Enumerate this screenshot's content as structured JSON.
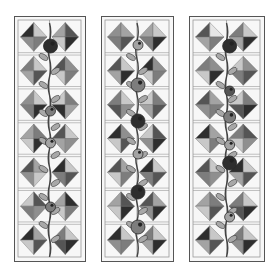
{
  "image": {
    "description": "Three vertical quilt table-runner panels with hourglass diamond blocks and a climbing vine with berries",
    "background": "#ffffff"
  },
  "shades": {
    "black": "#2e2e2e",
    "dark": "#555555",
    "mid": "#7d7d7d",
    "midlight": "#a3a3a3",
    "light": "#c8c8c8",
    "pale": "#e6e6e6",
    "print": "#8f8f8f"
  },
  "panels": [
    {
      "name": "left-panel",
      "x": 14,
      "width": 72,
      "rows": [
        [
          [
            "black",
            "light",
            "print",
            "mid"
          ],
          [
            "midlight",
            "dark",
            "light",
            "black"
          ]
        ],
        [
          [
            "mid",
            "light",
            "midlight",
            "dark"
          ],
          [
            "dark",
            "print",
            "light",
            "mid"
          ]
        ],
        [
          [
            "print",
            "light",
            "mid",
            "black"
          ],
          [
            "light",
            "mid",
            "black",
            "midlight"
          ]
        ],
        [
          [
            "midlight",
            "mid",
            "light",
            "black"
          ],
          [
            "dark",
            "light",
            "midlight",
            "print"
          ]
        ],
        [
          [
            "dark",
            "midlight",
            "print",
            "light"
          ],
          [
            "black",
            "light",
            "mid",
            "dark"
          ]
        ],
        [
          [
            "light",
            "dark",
            "mid",
            "print"
          ],
          [
            "midlight",
            "black",
            "light",
            "mid"
          ]
        ],
        [
          [
            "black",
            "midlight",
            "light",
            "dark"
          ],
          [
            "mid",
            "light",
            "dark",
            "black"
          ]
        ]
      ],
      "berries": [
        {
          "row": 0,
          "cx": 36,
          "cy": 29,
          "r": 7,
          "shade": "black"
        },
        {
          "row": 2,
          "cx": 36,
          "cy": 94,
          "r": 5,
          "shade": "mid"
        },
        {
          "row": 3,
          "cx": 36,
          "cy": 126,
          "r": 5,
          "shade": "midlight"
        },
        {
          "row": 5,
          "cx": 36,
          "cy": 190,
          "r": 5,
          "shade": "mid"
        }
      ]
    },
    {
      "name": "middle-panel",
      "x": 101,
      "width": 73,
      "rows": [
        [
          [
            "print",
            "midlight",
            "mid",
            "dark"
          ],
          [
            "midlight",
            "light",
            "mid",
            "black"
          ]
        ],
        [
          [
            "dark",
            "light",
            "midlight",
            "black"
          ],
          [
            "black",
            "print",
            "light",
            "mid"
          ]
        ],
        [
          [
            "mid",
            "light",
            "dark",
            "print"
          ],
          [
            "light",
            "mid",
            "midlight",
            "dark"
          ]
        ],
        [
          [
            "black",
            "print",
            "light",
            "dark"
          ],
          [
            "light",
            "dark",
            "print",
            "black"
          ]
        ],
        [
          [
            "dark",
            "midlight",
            "light",
            "mid"
          ],
          [
            "black",
            "light",
            "mid",
            "dark"
          ]
        ],
        [
          [
            "midlight",
            "dark",
            "light",
            "black"
          ],
          [
            "dark",
            "midlight",
            "print",
            "black"
          ]
        ],
        [
          [
            "black",
            "light",
            "print",
            "mid"
          ],
          [
            "mid",
            "light",
            "midlight",
            "black"
          ]
        ]
      ],
      "berries": [
        {
          "row": 1,
          "cx": 36,
          "cy": 28,
          "r": 5,
          "shade": "midlight"
        },
        {
          "row": 1,
          "cx": 36,
          "cy": 68,
          "r": 7,
          "shade": "mid"
        },
        {
          "row": 2,
          "cx": 36,
          "cy": 104,
          "r": 7,
          "shade": "black"
        },
        {
          "row": 3,
          "cx": 36,
          "cy": 137,
          "r": 5,
          "shade": "midlight"
        },
        {
          "row": 4,
          "cx": 36,
          "cy": 175,
          "r": 7,
          "shade": "black"
        },
        {
          "row": 5,
          "cx": 36,
          "cy": 210,
          "r": 7,
          "shade": "mid"
        }
      ]
    },
    {
      "name": "right-panel",
      "x": 189,
      "width": 76,
      "rows": [
        [
          [
            "dark",
            "pale",
            "midlight",
            "mid"
          ],
          [
            "mid",
            "light",
            "midlight",
            "black"
          ]
        ],
        [
          [
            "mid",
            "print",
            "light",
            "black"
          ],
          [
            "light",
            "print",
            "mid",
            "dark"
          ]
        ],
        [
          [
            "dark",
            "midlight",
            "print",
            "mid"
          ],
          [
            "light",
            "mid",
            "dark",
            "black"
          ]
        ],
        [
          [
            "black",
            "midlight",
            "light",
            "mid"
          ],
          [
            "mid",
            "dark",
            "light",
            "print"
          ]
        ],
        [
          [
            "dark",
            "light",
            "mid",
            "print"
          ],
          [
            "black",
            "light",
            "midlight",
            "dark"
          ]
        ],
        [
          [
            "midlight",
            "mid",
            "light",
            "dark"
          ],
          [
            "mid",
            "light",
            "dark",
            "black"
          ]
        ],
        [
          [
            "black",
            "light",
            "midlight",
            "dark"
          ],
          [
            "mid",
            "light",
            "print",
            "black"
          ]
        ]
      ],
      "berries": [
        {
          "row": 0,
          "cx": 38,
          "cy": 29,
          "r": 7,
          "shade": "black"
        },
        {
          "row": 2,
          "cx": 38,
          "cy": 74,
          "r": 5,
          "shade": "dark"
        },
        {
          "row": 2,
          "cx": 38,
          "cy": 100,
          "r": 6,
          "shade": "mid"
        },
        {
          "row": 3,
          "cx": 38,
          "cy": 128,
          "r": 5,
          "shade": "midlight"
        },
        {
          "row": 4,
          "cx": 38,
          "cy": 146,
          "r": 7,
          "shade": "black"
        },
        {
          "row": 6,
          "cx": 38,
          "cy": 200,
          "r": 5,
          "shade": "midlight"
        }
      ]
    }
  ],
  "layout": {
    "top": 16,
    "height": 246,
    "row_count": 7,
    "leaf_color": "#a8a8a8",
    "stem_color": "#444444",
    "line_color": "#9a9a9a"
  }
}
